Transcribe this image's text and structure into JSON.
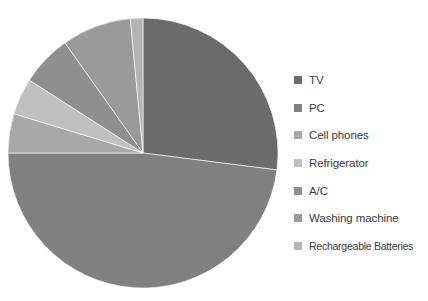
{
  "chart_data": {
    "type": "pie",
    "title": "",
    "subtitle": "",
    "xlabel": "",
    "ylabel": "",
    "grid": false,
    "legend_position": "right",
    "background_color": "#ffffff",
    "start_angle_deg": 0,
    "direction": "clockwise",
    "center": {
      "x": 143,
      "y": 153
    },
    "radius": 135,
    "categories": [
      "TV",
      "PC",
      "Cell phones",
      "Refrigerator",
      "A/C",
      "Washing machine",
      "Rechargeable Batteries"
    ],
    "values": [
      27,
      48,
      4.7,
      4.4,
      6.1,
      8.3,
      1.5
    ],
    "units": "percent",
    "colors": [
      "#6b6b6b",
      "#808080",
      "#a8a8a8",
      "#c0c0c0",
      "#8f8f8f",
      "#9a9a9a",
      "#b4b4b4"
    ],
    "slices": [
      {
        "label": "TV",
        "value": 27,
        "start_deg": 0,
        "end_deg": 97.2,
        "color": "#6b6b6b"
      },
      {
        "label": "PC",
        "value": 48,
        "start_deg": 97.2,
        "end_deg": 270.0,
        "color": "#808080"
      },
      {
        "label": "Cell phones",
        "value": 4.7,
        "start_deg": 270.0,
        "end_deg": 286.9,
        "color": "#a8a8a8"
      },
      {
        "label": "Refrigerator",
        "value": 4.4,
        "start_deg": 286.9,
        "end_deg": 302.7,
        "color": "#c0c0c0"
      },
      {
        "label": "A/C",
        "value": 6.1,
        "start_deg": 302.7,
        "end_deg": 324.7,
        "color": "#8f8f8f"
      },
      {
        "label": "Washing machine",
        "value": 8.3,
        "start_deg": 324.7,
        "end_deg": 354.6,
        "color": "#9a9a9a"
      },
      {
        "label": "Rechargeable Batteries",
        "value": 1.5,
        "start_deg": 354.6,
        "end_deg": 360.0,
        "color": "#b4b4b4"
      }
    ]
  },
  "legend": {
    "items": [
      {
        "label": "TV",
        "color": "#6b6b6b"
      },
      {
        "label": "PC",
        "color": "#808080"
      },
      {
        "label": "Cell phones",
        "color": "#a8a8a8"
      },
      {
        "label": "Refrigerator",
        "color": "#c0c0c0"
      },
      {
        "label": "A/C",
        "color": "#8f8f8f"
      },
      {
        "label": "Washing machine",
        "color": "#9a9a9a"
      },
      {
        "label": "Rechargeable Batteries",
        "color": "#b4b4b4"
      }
    ]
  }
}
